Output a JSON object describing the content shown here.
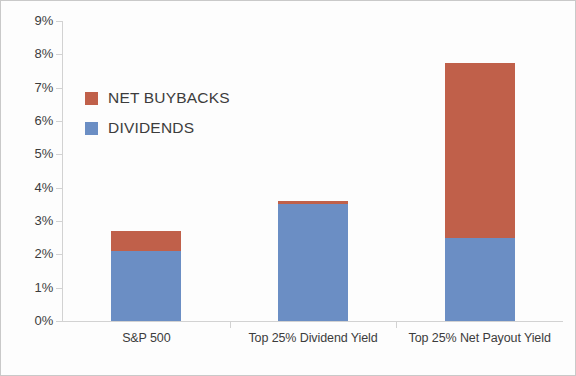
{
  "chart_data": {
    "type": "bar",
    "title": "",
    "xlabel": "",
    "ylabel": "",
    "stacked": true,
    "grid": false,
    "legend_position": "upper-left",
    "ylim": [
      0,
      9
    ],
    "ytick_labels": [
      "9%",
      "8%",
      "7%",
      "6%",
      "5%",
      "4%",
      "3%",
      "2%",
      "1%",
      "0%"
    ],
    "ytick_values": [
      9,
      8,
      7,
      6,
      5,
      4,
      3,
      2,
      1,
      0
    ],
    "categories": [
      "S&P 500",
      "Top 25% Dividend Yield",
      "Top 25% Net Payout Yield"
    ],
    "series": [
      {
        "name": "NET BUYBACKS",
        "color": "#C0604A",
        "values": [
          0.6,
          0.1,
          5.25
        ]
      },
      {
        "name": "DIVIDENDS",
        "color": "#6B8EC4",
        "values": [
          2.1,
          3.5,
          2.5
        ]
      }
    ],
    "totals": [
      2.7,
      3.6,
      7.75
    ]
  },
  "legend": {
    "items": [
      {
        "label": "NET BUYBACKS",
        "color": "#C0604A"
      },
      {
        "label": "DIVIDENDS",
        "color": "#6B8EC4"
      }
    ]
  }
}
